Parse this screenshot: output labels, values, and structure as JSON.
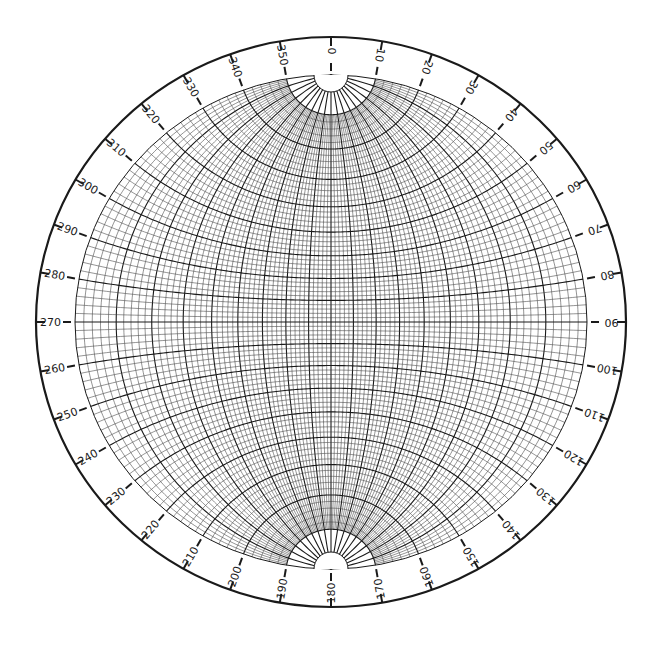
{
  "diagram": {
    "type": "wulff-stereonet",
    "grid_interval_deg": 2,
    "major_interval_deg": 10,
    "polar_cutoff_deg": 10,
    "azimuth_ring": {
      "tick_interval_deg": 10,
      "labels": [
        "0",
        "10",
        "20",
        "30",
        "40",
        "50",
        "60",
        "70",
        "80",
        "90",
        "100",
        "110",
        "120",
        "130",
        "140",
        "150",
        "160",
        "170",
        "180",
        "190",
        "200",
        "210",
        "220",
        "230",
        "240",
        "250",
        "260",
        "270",
        "280",
        "290",
        "300",
        "310",
        "320",
        "330",
        "340",
        "350"
      ]
    },
    "colors": {
      "background": "#ffffff",
      "line": "#1a1a1a",
      "minor_line": "#3a3a3a"
    }
  }
}
